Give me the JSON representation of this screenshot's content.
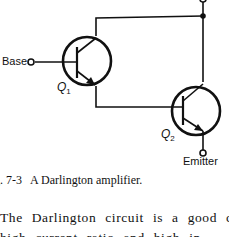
{
  "figure": {
    "labels": {
      "base": "Base",
      "emitter": "Emitter",
      "q1": "Q",
      "q1_sub": "1",
      "q2": "Q",
      "q2_sub": "2"
    }
  },
  "caption": {
    "number": "g. 7-3",
    "title": "A Darlington amplifier."
  },
  "body": {
    "line1": "The Darlington circuit is a good cho",
    "line2": "    high current ratio  and high in"
  }
}
